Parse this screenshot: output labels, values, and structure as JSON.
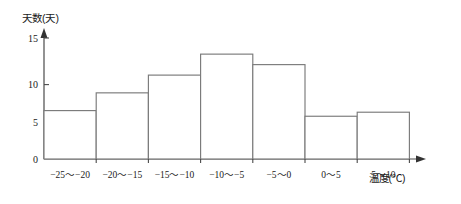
{
  "chart_data": {
    "type": "bar",
    "title": "",
    "subtitle": "",
    "xlabel": "温度(℃)",
    "ylabel": "天数(天)",
    "categories": [
      "-25~-20",
      "-20~-15",
      "-15~-10",
      "-10~-5",
      "-5~0",
      "0~5",
      "5~10"
    ],
    "values": [
      6,
      8.2,
      10.4,
      13,
      11.7,
      5.3,
      5.8
    ],
    "ylim": [
      0,
      16
    ],
    "y_ticks": [
      "0",
      "5",
      "10",
      "15"
    ],
    "y_tick_values": [
      0,
      5,
      10,
      15
    ],
    "grid": false,
    "legend": null,
    "annotations": []
  },
  "axes": {
    "y_axis_title": "天数(天)",
    "x_axis_title": "温度(℃)",
    "origin_label": "0"
  },
  "style": {
    "bar_stroke": "#7a7a7a",
    "bar_fill": "#ffffff",
    "axis_color": "#4a4a4a",
    "text_color": "#1a1a1a",
    "background": "#ffffff"
  }
}
